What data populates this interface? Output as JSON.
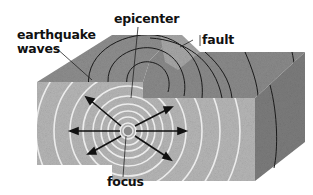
{
  "diagram": {
    "labels": {
      "earthquake_waves_line1": "earthquake",
      "earthquake_waves_line2": "waves",
      "epicenter": "epicenter",
      "fault": "fault",
      "focus": "focus"
    },
    "colors": {
      "top_surface": "#8a8a8a",
      "top_surface_light": "#a8a8a8",
      "front_face": "#b4b4b4",
      "right_face": "#7a7a7a",
      "wave_lines_top": "#1a1a1a",
      "wave_rings_front": "#e8e8e8",
      "arrows": "#111111",
      "focus_point": "#8c8c8c"
    }
  }
}
